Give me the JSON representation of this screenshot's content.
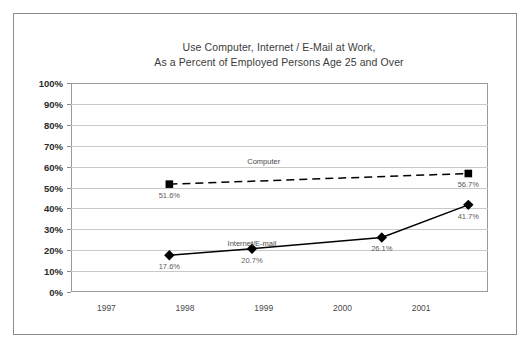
{
  "chart_data": {
    "type": "line",
    "title": "Use Computer, Internet / E-Mail at Work,",
    "subtitle": "As a Percent of Employed Persons Age 25 and Over",
    "xlabel": "",
    "ylabel": "",
    "ylim": [
      0,
      100
    ],
    "ytick_labels": [
      "100%",
      "90%",
      "80%",
      "70%",
      "60%",
      "50%",
      "40%",
      "30%",
      "20%",
      "10%",
      "0%"
    ],
    "ytick_values": [
      100,
      90,
      80,
      70,
      60,
      50,
      40,
      30,
      20,
      10,
      0
    ],
    "xtick_labels": [
      "1997",
      "1998",
      "1999",
      "2000",
      "2001"
    ],
    "xtick_values": [
      1997,
      1998,
      1999,
      2000,
      2001
    ],
    "xlim": [
      1996.55,
      2001.85
    ],
    "grid": true,
    "legend_position": "inline-annotation",
    "series": [
      {
        "name": "Computer",
        "style": "dashed",
        "marker": "square",
        "color": "#000000",
        "annotation_label": "Computer",
        "annotation_x": 1999.0,
        "annotation_y": 64.5,
        "points": [
          {
            "x": 1997.8,
            "y": 51.6,
            "label": "51.6%"
          },
          {
            "x": 2001.6,
            "y": 56.7,
            "label": "56.7%"
          }
        ]
      },
      {
        "name": "Internet/E-mail",
        "style": "solid",
        "marker": "diamond",
        "color": "#000000",
        "annotation_label": "Internet/E-mail",
        "annotation_x": 1998.85,
        "annotation_y": 25.5,
        "points": [
          {
            "x": 1997.8,
            "y": 17.6,
            "label": "17.6%"
          },
          {
            "x": 1998.85,
            "y": 20.7,
            "label": "20.7%"
          },
          {
            "x": 2000.5,
            "y": 26.1,
            "label": "26.1%"
          },
          {
            "x": 2001.6,
            "y": 41.7,
            "label": "41.7%"
          }
        ]
      }
    ]
  },
  "colors": {
    "frame": "#8c8c8c",
    "gridline": "#c9c9c9",
    "plot_border": "#9a9a9a",
    "series_line": "#000000",
    "label_text": "#5a5a5a",
    "axis_text": "#2b2b2b",
    "title_text": "#3b3b3b",
    "background": "#ffffff"
  }
}
